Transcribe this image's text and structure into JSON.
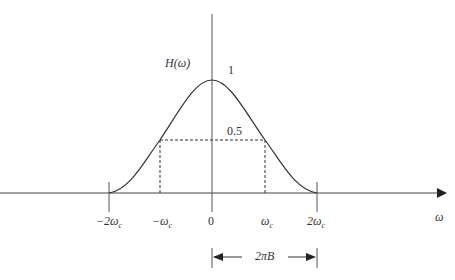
{
  "diagram": {
    "function_label": "H(ω)",
    "peak_label": "1",
    "half_label": "0.5",
    "x_axis_label": "ω",
    "ticks": [
      "−2ω",
      "−ω",
      "0",
      "ω",
      "2ω"
    ],
    "tick_subscript": "c",
    "bandwidth_label": "2πB"
  }
}
